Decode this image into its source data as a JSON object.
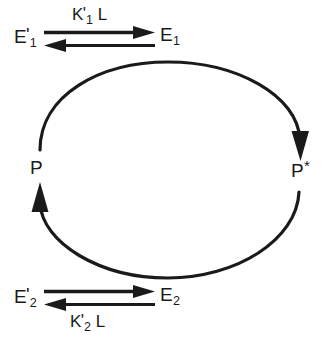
{
  "diagram": {
    "type": "cycle-diagram",
    "colors": {
      "stroke": "#1a1a1a",
      "text": "#1a1a1a",
      "background": "#ffffff"
    },
    "nodes": {
      "e1_prime": {
        "base": "E",
        "prime": "'",
        "subscript": "1"
      },
      "e1": {
        "base": "E",
        "prime": "",
        "subscript": "1"
      },
      "e2_prime": {
        "base": "E",
        "prime": "'",
        "subscript": "2"
      },
      "e2": {
        "base": "E",
        "prime": "",
        "subscript": "2"
      },
      "p": {
        "base": "P",
        "star": ""
      },
      "p_star": {
        "base": "P",
        "star": "*"
      }
    },
    "constants": {
      "k1": {
        "base": "K",
        "prime": "'",
        "subscript": "1",
        "ligand": "L"
      },
      "k2": {
        "base": "K",
        "prime": "'",
        "subscript": "2",
        "ligand": "L"
      }
    },
    "equilibria": [
      {
        "id": "top-equilibrium",
        "left_species": "E'1",
        "right_species": "E1",
        "constant_label": "K'1 L",
        "constant_position": "above",
        "forward_direction": "right",
        "reverse_direction": "left"
      },
      {
        "id": "bottom-equilibrium",
        "left_species": "E'2",
        "right_species": "E2",
        "constant_label": "K'2 L",
        "constant_position": "below",
        "forward_direction": "right",
        "reverse_direction": "left"
      }
    ],
    "cycle": {
      "top_arc": {
        "from": "P",
        "to": "P*",
        "direction": "clockwise",
        "arrowhead_at": "P*"
      },
      "bottom_arc": {
        "from": "P*",
        "to": "P",
        "direction": "clockwise",
        "arrowhead_at": "P"
      }
    }
  }
}
